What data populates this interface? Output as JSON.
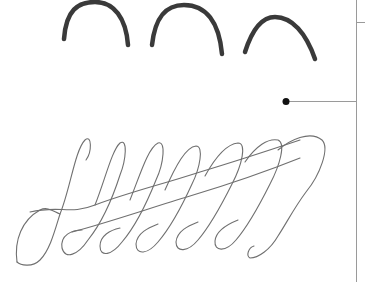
{
  "image": {
    "description": "Handwriting sample: three bold arches and a cursive looped pattern with a reference line",
    "colors": {
      "background": "#ffffff",
      "arch_stroke": "#3a3a3a",
      "loop_stroke": "#6a6a6a",
      "guide_line": "#9a9a9a",
      "dot": "#111111"
    },
    "arches": [
      {
        "x1": 64,
        "y1": 39,
        "cx": 95,
        "cy": -28,
        "x2": 128,
        "y2": 45
      },
      {
        "x1": 152,
        "y1": 45,
        "cx": 183,
        "cy": -14,
        "x2": 222,
        "y2": 54
      },
      {
        "x1": 245,
        "y1": 52,
        "cx": 270,
        "cy": 0,
        "x2": 315,
        "y2": 59
      }
    ],
    "loops_count": 7,
    "annotation": {
      "dot_x": 286,
      "dot_y": 101,
      "line_end_x": 356,
      "vline_x": 356,
      "tick_y": 22
    }
  }
}
